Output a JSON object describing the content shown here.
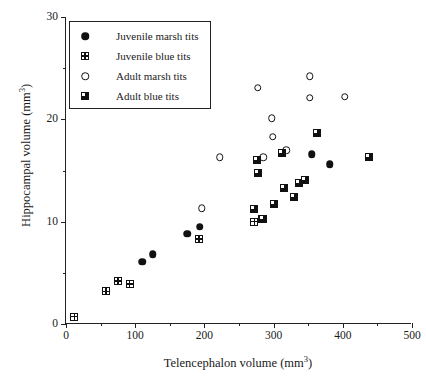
{
  "chart_data": {
    "type": "scatter",
    "title": "",
    "xlabel": "Telencephalon volume (mm3)",
    "xlabel_base": "Telencephalon volume (mm",
    "xlabel_sup": "3",
    "xlabel_tail": ")",
    "ylabel": "Hippocampal volume (mm3)",
    "ylabel_base": "Hippocampal volume (mm",
    "ylabel_sup": "3",
    "ylabel_tail": ")",
    "xlim": [
      0,
      500
    ],
    "ylim": [
      0,
      30
    ],
    "xticks": [
      0,
      100,
      200,
      300,
      400,
      500
    ],
    "xtick_labels": [
      "0",
      "100",
      "200",
      "300",
      "400",
      "500"
    ],
    "xminor_ticks": [
      50,
      150,
      250,
      350,
      450
    ],
    "yticks": [
      0,
      10,
      20,
      30
    ],
    "ytick_labels": [
      "0",
      "10",
      "20",
      "30"
    ],
    "yminor_ticks": [
      5,
      15,
      25
    ],
    "grid": false,
    "legend_position": "upper-left",
    "marker_color": "#111111",
    "axis_color": "#222222",
    "background": "#ffffff",
    "series": [
      {
        "name": "Juvenile marsh tits",
        "marker": "filled-circle",
        "points": [
          [
            110,
            6.1
          ],
          [
            125,
            6.8
          ],
          [
            175,
            8.8
          ],
          [
            193,
            9.5
          ],
          [
            355,
            16.6
          ],
          [
            381,
            15.6
          ]
        ]
      },
      {
        "name": "Juvenile blue tits",
        "marker": "grid-square",
        "points": [
          [
            12,
            0.7
          ],
          [
            58,
            3.2
          ],
          [
            75,
            4.2
          ],
          [
            92,
            3.9
          ],
          [
            192,
            8.3
          ],
          [
            272,
            10.0
          ],
          [
            283,
            10.3
          ],
          [
            315,
            13.3
          ]
        ]
      },
      {
        "name": "Adult marsh tits",
        "marker": "open-circle",
        "points": [
          [
            196,
            11.3
          ],
          [
            222,
            16.3
          ],
          [
            277,
            23.1
          ],
          [
            285,
            16.3
          ],
          [
            297,
            20.1
          ],
          [
            299,
            18.3
          ],
          [
            318,
            17.0
          ],
          [
            352,
            24.2
          ],
          [
            352,
            22.1
          ],
          [
            403,
            22.2
          ]
        ]
      },
      {
        "name": "Adult blue tits",
        "marker": "half-square",
        "points": [
          [
            272,
            11.2
          ],
          [
            276,
            16.0
          ],
          [
            277,
            14.8
          ],
          [
            285,
            10.3
          ],
          [
            301,
            11.7
          ],
          [
            312,
            16.7
          ],
          [
            315,
            13.3
          ],
          [
            330,
            12.4
          ],
          [
            337,
            13.8
          ],
          [
            345,
            14.1
          ],
          [
            362,
            18.7
          ],
          [
            438,
            16.3
          ]
        ]
      }
    ]
  }
}
